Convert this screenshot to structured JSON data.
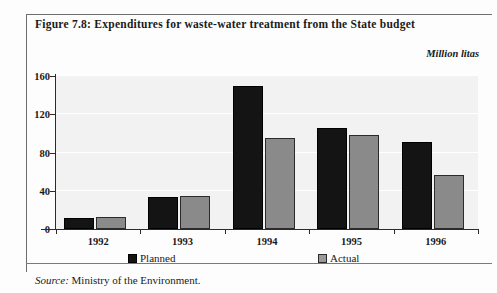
{
  "figure": {
    "title": "Figure 7.8:  Expenditures for waste-water treatment from the State budget",
    "unit_label": "Million litas",
    "source_lead": "Source:",
    "source_text": "Ministry of the Environment."
  },
  "legend": {
    "position": "bottom",
    "entries": [
      {
        "label": "Planned",
        "color": "#141414"
      },
      {
        "label": "Actual",
        "color": "#9a9a9a"
      }
    ]
  },
  "chart_data": {
    "type": "bar",
    "title": "Figure 7.8:  Expenditures for waste-water treatment from the State budget",
    "subtitle": "",
    "xlabel": "",
    "ylabel": "Million litas",
    "categories": [
      "1992",
      "1993",
      "1994",
      "1995",
      "1996"
    ],
    "series": [
      {
        "name": "Planned",
        "color": "#141414",
        "values": [
          12,
          34,
          150,
          106,
          91
        ]
      },
      {
        "name": "Actual",
        "color": "#9a9a9a",
        "values": [
          13,
          35,
          95,
          98,
          57
        ]
      }
    ],
    "ylim": [
      0,
      160
    ],
    "yticks": [
      0,
      40,
      80,
      120,
      160
    ],
    "ytick_labels": [
      "0",
      "40",
      "80",
      "120",
      "160"
    ],
    "grid": true,
    "grid_axis": "y",
    "legend": "bottom",
    "annotations": []
  }
}
